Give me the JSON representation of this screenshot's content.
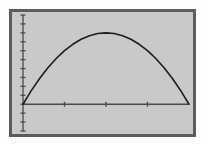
{
  "figure": {
    "background_color": "#fdfdfd",
    "plot_background_color": "#c9c9c9",
    "frame_color": "#5c5c5c",
    "frame_width_px": 3,
    "axis_color": "#4a4a4a",
    "curve_color": "#1c1c1c",
    "title": "",
    "caption": ""
  },
  "chart_data": {
    "type": "line",
    "title": "",
    "subtitle": "",
    "xlabel": "",
    "ylabel": "",
    "legend": [],
    "legend_position": "none",
    "grid": false,
    "xlim": [
      0,
      4
    ],
    "ylim": [
      -3,
      10
    ],
    "x_axis": {
      "label": "",
      "tick_labels": [],
      "tick_values": [
        1,
        2,
        3
      ],
      "axis_line_y_value": 0,
      "tick_direction": "both",
      "tick_length_px": 5
    },
    "y_axis": {
      "label": "",
      "tick_labels": [],
      "tick_values": [
        -3,
        -2,
        -1,
        0,
        1,
        2,
        3,
        4,
        5,
        6,
        7,
        8,
        9,
        10
      ],
      "axis_line_x_value": 0,
      "tick_direction": "both",
      "tick_length_px": 5
    },
    "series": [
      {
        "name": "parabola",
        "type": "line",
        "color": "#1c1c1c",
        "line_width_px": 1.6,
        "equation": "y = 4x(4-x)/4",
        "x": [
          0.0,
          0.2,
          0.4,
          0.6,
          0.8,
          1.0,
          1.2,
          1.4,
          1.6,
          1.8,
          2.0,
          2.2,
          2.4,
          2.6,
          2.8,
          3.0,
          3.2,
          3.4,
          3.6,
          3.8,
          4.0
        ],
        "values": [
          0.0,
          1.52,
          2.88,
          4.08,
          5.12,
          6.0,
          6.72,
          7.28,
          7.68,
          7.92,
          8.0,
          7.92,
          7.68,
          7.28,
          6.72,
          6.0,
          5.12,
          4.08,
          2.88,
          1.52,
          0.0
        ]
      }
    ],
    "annotations": [
      {
        "name": "vertex",
        "x": 2.0,
        "y": 8.0,
        "label": ""
      },
      {
        "name": "left-root",
        "x": 0.0,
        "y": 0.0,
        "label": ""
      },
      {
        "name": "right-root",
        "x": 4.0,
        "y": 0.0,
        "label": ""
      }
    ]
  }
}
